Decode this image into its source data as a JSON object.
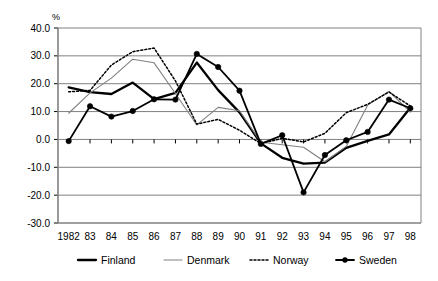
{
  "chart_data": {
    "type": "line",
    "title": "",
    "subtitle": "",
    "xlabel": "",
    "ylabel": "%",
    "unit_label": "%",
    "grid": true,
    "legend_position": "bottom",
    "ylim": [
      -30.0,
      40.0
    ],
    "ytick_labels": [
      "40.0",
      "30.0",
      "20.0",
      "10.0",
      "0.0",
      "-10.0",
      "-20.0",
      "-30.0"
    ],
    "ytick_values": [
      40.0,
      30.0,
      20.0,
      10.0,
      0.0,
      -10.0,
      -20.0,
      -30.0
    ],
    "categories": [
      "1982",
      "83",
      "84",
      "85",
      "86",
      "87",
      "88",
      "89",
      "90",
      "91",
      "92",
      "93",
      "94",
      "95",
      "96",
      "97",
      "98"
    ],
    "x": [
      1982,
      1983,
      1984,
      1985,
      1986,
      1987,
      1988,
      1989,
      1990,
      1991,
      1992,
      1993,
      1994,
      1995,
      1996,
      1997,
      1998
    ],
    "series": [
      {
        "name": "Finland",
        "color": "#000000",
        "style": "thick-solid",
        "marker": "none",
        "values": [
          18.7,
          17.0,
          16.3,
          20.4,
          14.5,
          16.7,
          27.6,
          17.7,
          9.7,
          -1.4,
          -6.6,
          -8.7,
          -8.3,
          -3.0,
          -0.5,
          1.8,
          11.4
        ]
      },
      {
        "name": "Denmark",
        "color": "#808080",
        "style": "thin-solid",
        "marker": "none",
        "values": [
          9.4,
          16.7,
          22.0,
          28.8,
          27.5,
          16.5,
          5.2,
          11.5,
          10.3,
          -1.0,
          -1.9,
          -2.8,
          -8.0,
          -2.5,
          12.3,
          17.3,
          9.8
        ]
      },
      {
        "name": "Norway",
        "color": "#000000",
        "style": "dotted",
        "marker": "none",
        "values": [
          17.1,
          17.6,
          26.7,
          31.5,
          32.8,
          21.0,
          5.5,
          7.2,
          3.3,
          -1.5,
          0.4,
          -0.9,
          2.2,
          9.6,
          12.6,
          17.0,
          12.0
        ]
      },
      {
        "name": "Sweden",
        "color": "#000000",
        "style": "solid-marker",
        "marker": "circle",
        "values": [
          -0.6,
          11.9,
          8.2,
          10.2,
          14.4,
          14.3,
          30.7,
          26.0,
          17.5,
          -1.6,
          1.5,
          -19.0,
          -5.6,
          -0.3,
          2.7,
          14.3,
          11.2
        ]
      }
    ],
    "legend": [
      {
        "label": "Finland",
        "swatch": "thick-solid"
      },
      {
        "label": "Denmark",
        "swatch": "thin-solid"
      },
      {
        "label": "Norway",
        "swatch": "dotted"
      },
      {
        "label": "Sweden",
        "swatch": "solid-marker"
      }
    ]
  }
}
